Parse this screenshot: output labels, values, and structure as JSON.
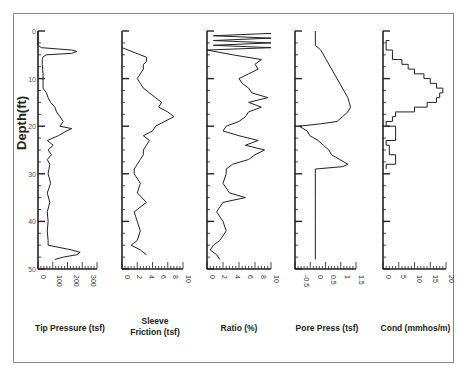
{
  "chart_data": {
    "type": "line",
    "title": "",
    "layout": "five side-by-side depth log panels sharing a vertical depth axis (depth increasing downward)",
    "ylabel": "Depth(ft)",
    "ylim": [
      0,
      50
    ],
    "y_ticks": [
      0,
      10,
      20,
      30,
      40,
      50
    ],
    "grid": false,
    "legend": null,
    "panels": [
      {
        "name": "Tip Pressure",
        "xlabel": "Tip Pressure (tsf)",
        "xlim": [
          0,
          350
        ],
        "x_ticks": [
          0,
          100,
          200,
          300
        ],
        "depth": [
          0,
          3,
          3.5,
          4,
          4.3,
          4.7,
          5,
          5.4,
          6,
          7,
          9,
          10,
          12,
          13,
          14,
          15,
          16,
          17,
          18,
          19,
          20,
          20.5,
          21,
          22,
          23,
          24,
          25,
          26,
          27,
          28,
          30,
          32,
          34,
          36,
          38,
          40,
          42,
          44,
          45,
          46,
          46.5,
          47,
          47.5,
          48
        ],
        "values": [
          0,
          0,
          20,
          200,
          230,
          200,
          50,
          30,
          25,
          25,
          30,
          30,
          30,
          50,
          60,
          75,
          100,
          110,
          130,
          150,
          130,
          200,
          170,
          120,
          55,
          90,
          60,
          80,
          55,
          70,
          60,
          75,
          55,
          70,
          55,
          60,
          55,
          60,
          60,
          200,
          250,
          230,
          150,
          100
        ]
      },
      {
        "name": "Sleeve Friction",
        "xlabel": "Sleeve\nFriction (tsf)",
        "xlim": [
          0,
          10
        ],
        "x_ticks": [
          0,
          2,
          4,
          6,
          8,
          10
        ],
        "depth": [
          3.5,
          4.5,
          5.5,
          6.5,
          7,
          8,
          9,
          10,
          11,
          12,
          13,
          14,
          15,
          16,
          17,
          18,
          19,
          20,
          21,
          22,
          23,
          24,
          25,
          26,
          27,
          28,
          29,
          30,
          32,
          34,
          36,
          38,
          40,
          42,
          44,
          45,
          46,
          47
        ],
        "values": [
          0,
          2,
          4,
          4,
          3.5,
          3.5,
          3,
          2.5,
          3,
          3.5,
          4.5,
          5.5,
          6.5,
          6,
          7.5,
          8.5,
          7,
          5.5,
          5,
          3.5,
          4.5,
          4,
          3.5,
          3.5,
          3,
          2.5,
          2,
          2,
          3,
          2.5,
          4,
          2,
          2.5,
          3,
          2.5,
          1.5,
          3,
          4
        ]
      },
      {
        "name": "Ratio",
        "xlabel": "Ratio (%)",
        "xlim": [
          0,
          10
        ],
        "x_ticks": [
          0,
          2,
          4,
          6,
          8,
          10
        ],
        "depth": [
          0.5,
          1,
          1.5,
          2,
          2.5,
          3,
          3.5,
          4,
          5,
          6,
          7,
          8,
          9,
          10,
          11,
          12,
          13,
          14,
          15,
          16,
          17,
          18,
          19,
          20,
          21,
          22,
          23,
          24,
          25,
          26,
          27,
          28,
          29,
          30,
          32,
          34,
          35,
          36,
          38,
          40,
          42,
          44,
          45,
          46,
          47,
          48
        ],
        "values": [
          10,
          1,
          10,
          1,
          10,
          1,
          10,
          0,
          4,
          8.5,
          7.5,
          8,
          6.5,
          5,
          5.5,
          6.5,
          7,
          9.5,
          6.5,
          8.5,
          6.5,
          6,
          5,
          3,
          2.5,
          5,
          8,
          6,
          9,
          7.5,
          6.5,
          4,
          3,
          3,
          2.5,
          3.5,
          6,
          2.5,
          1.5,
          2.5,
          3,
          2,
          1,
          0.5,
          1.5,
          2
        ]
      },
      {
        "name": "Pore Press",
        "xlabel": "Pore Press (tsf)",
        "xlim": [
          -0.75,
          1.5
        ],
        "x_ticks": [
          -0.5,
          0,
          0.5,
          1,
          1.5
        ],
        "depth": [
          0,
          3,
          4,
          6,
          8,
          10,
          12,
          13,
          14,
          15,
          16,
          17,
          18,
          19,
          19.5,
          20,
          21,
          22,
          23,
          24,
          25,
          26,
          27,
          28,
          28.5,
          29,
          30,
          35,
          40,
          45,
          48
        ],
        "values": [
          0,
          0,
          0.2,
          0.4,
          0.6,
          0.8,
          1.0,
          1.1,
          1.2,
          1.25,
          1.3,
          1.2,
          1.0,
          0.8,
          0.2,
          -0.6,
          -0.3,
          -0.2,
          0.1,
          0.3,
          0.5,
          0.6,
          0.9,
          1.2,
          1.0,
          0.0,
          0.0,
          0.0,
          0.0,
          0.0,
          0.0
        ]
      },
      {
        "name": "Cond",
        "xlabel": "Cond (mmhos/m)",
        "xlim": [
          0,
          20
        ],
        "x_ticks": [
          0,
          5,
          10,
          15,
          20
        ],
        "depth": [
          2,
          4,
          6,
          7,
          8,
          9,
          10,
          11,
          12,
          13,
          14,
          15,
          16,
          17,
          18,
          19,
          20,
          23,
          24,
          26,
          28,
          29
        ],
        "values": [
          2,
          1,
          3,
          6,
          8,
          10,
          13,
          15,
          17,
          19,
          18,
          17,
          14,
          10,
          4,
          3,
          1,
          4,
          1,
          2,
          4,
          1
        ]
      }
    ]
  },
  "labels": {
    "ylabel": "Depth(ft)",
    "depth_ticks": [
      "0",
      "10",
      "20",
      "30",
      "40",
      "50"
    ],
    "panels": [
      {
        "title": "Tip Pressure (tsf)",
        "ticks": [
          "0",
          "100",
          "200",
          "300"
        ]
      },
      {
        "title_line1": "Sleeve",
        "title_line2": "Friction (tsf)",
        "ticks": [
          "0",
          "2",
          "4",
          "6",
          "8",
          "10"
        ]
      },
      {
        "title": "Ratio (%)",
        "ticks": [
          "0",
          "2",
          "4",
          "6",
          "8",
          "10"
        ]
      },
      {
        "title": "Pore Press (tsf)",
        "ticks": [
          "-0.5",
          "0",
          "0.5",
          "1",
          "1.5"
        ]
      },
      {
        "title": "Cond (mmhos/m)",
        "ticks": [
          "0",
          "5",
          "10",
          "15",
          "20"
        ]
      }
    ]
  },
  "colors": {
    "line": "#222222",
    "frame": "#8a8a8a",
    "axis": "#222222"
  }
}
